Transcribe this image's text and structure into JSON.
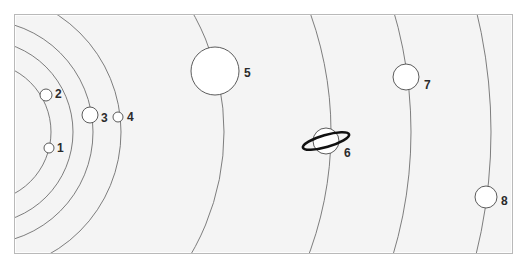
{
  "figure": {
    "kind": "solar-system-diagram",
    "background_color": "#f4f4f4",
    "border_color": "#b9b9b9",
    "page_color": "#ffffff",
    "orbit_stroke_color": "#6f6f6f",
    "planet_fill_color": "#ffffff",
    "planet_stroke_color": "#4a4a4a",
    "ring_color": "#111111",
    "label_color": "#2b2b2b",
    "frame": {
      "x": 14,
      "y": 14,
      "width": 497,
      "height": 238
    }
  },
  "orbits": {
    "center_x": -20,
    "center_y": 131,
    "radii": [
      70,
      92,
      112,
      140,
      243,
      350,
      430,
      510
    ]
  },
  "planets": [
    {
      "id": 1,
      "label": "1",
      "cx": 48,
      "cy": 147,
      "r": 5,
      "label_x": 56,
      "label_y": 141,
      "ring": false
    },
    {
      "id": 2,
      "label": "2",
      "cx": 45,
      "cy": 94,
      "r": 6,
      "label_x": 54,
      "label_y": 87,
      "ring": false
    },
    {
      "id": 3,
      "label": "3",
      "cx": 89,
      "cy": 114,
      "r": 8,
      "label_x": 100,
      "label_y": 111,
      "ring": false
    },
    {
      "id": 4,
      "label": "4",
      "cx": 117,
      "cy": 116,
      "r": 5,
      "label_x": 126,
      "label_y": 110,
      "ring": false
    },
    {
      "id": 5,
      "label": "5",
      "cx": 214,
      "cy": 70,
      "r": 24,
      "label_x": 243,
      "label_y": 66,
      "ring": false
    },
    {
      "id": 6,
      "label": "6",
      "cx": 325,
      "cy": 140,
      "r": 13,
      "label_x": 343,
      "label_y": 146,
      "ring": true
    },
    {
      "id": 7,
      "label": "7",
      "cx": 405,
      "cy": 76,
      "r": 13,
      "label_x": 423,
      "label_y": 78,
      "ring": false
    },
    {
      "id": 8,
      "label": "8",
      "cx": 485,
      "cy": 196,
      "r": 11,
      "label_x": 500,
      "label_y": 194,
      "ring": false
    }
  ],
  "ring": {
    "rx": 24,
    "ry": 6,
    "rotation_deg": -16,
    "stroke_width": 2.6
  }
}
